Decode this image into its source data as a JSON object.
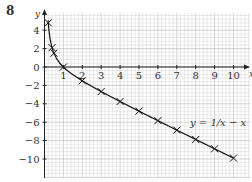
{
  "question_number": "8",
  "chart_data": {
    "type": "line",
    "title": "",
    "xlabel": "x",
    "ylabel": "y",
    "xlim": [
      0,
      10.5
    ],
    "ylim": [
      -12,
      5.5
    ],
    "x_ticks": [
      1,
      2,
      3,
      4,
      5,
      6,
      7,
      8,
      9,
      10
    ],
    "y_ticks": [
      4,
      2,
      0,
      -2,
      -4,
      -6,
      -8,
      -10
    ],
    "grid": true,
    "annotation": "y = 1/x − x",
    "series": [
      {
        "name": "y = 1/x − x",
        "marker": "x",
        "x": [
          0.2,
          0.4,
          0.5,
          1,
          2,
          3,
          4,
          5,
          6,
          7,
          8,
          9,
          10
        ],
        "y": [
          4.8,
          2.1,
          1.5,
          0,
          -1.5,
          -2.67,
          -3.75,
          -4.8,
          -5.83,
          -6.86,
          -7.88,
          -8.89,
          -9.9
        ]
      }
    ]
  },
  "colors": {
    "grid_minor": "#d4d4d4",
    "grid_major": "#a8a8a8",
    "axis": "#222222",
    "curve": "#111111"
  }
}
